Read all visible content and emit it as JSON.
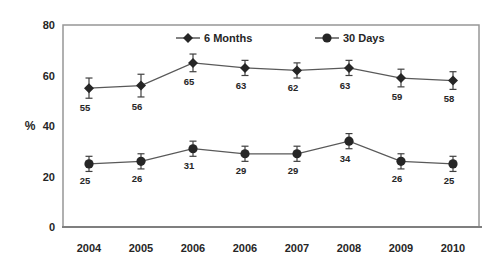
{
  "chart_data": {
    "type": "line",
    "title": "",
    "xlabel": "",
    "ylabel": "%",
    "ylim": [
      0,
      80
    ],
    "yticks": [
      0,
      20,
      40,
      60,
      80
    ],
    "grid": false,
    "legend_position": "top-inside",
    "data_labels": true,
    "error_bars": true,
    "categories": [
      "2004",
      "2005",
      "2006",
      "2006",
      "2007",
      "2008",
      "2009",
      "2010"
    ],
    "series": [
      {
        "name": "6 Months",
        "marker": "diamond",
        "values": [
          55,
          56,
          65,
          63,
          62,
          63,
          59,
          58
        ],
        "errors": [
          4,
          4.5,
          3.5,
          3,
          3,
          3,
          3.5,
          3.5
        ]
      },
      {
        "name": "30 Days",
        "marker": "circle",
        "values": [
          25,
          26,
          31,
          29,
          29,
          34,
          26,
          25
        ],
        "errors": [
          3,
          3,
          3,
          3,
          3,
          3,
          3,
          3
        ]
      }
    ],
    "colors": {
      "line": "#595959",
      "marker": "#262626",
      "error_bar": "#404040",
      "text": "#262626",
      "plot_border": "#979797",
      "axis_line": "#7f7f7f",
      "background": "#ffffff"
    }
  }
}
